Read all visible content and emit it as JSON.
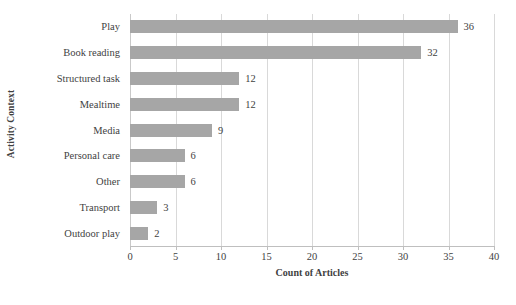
{
  "chart_data": {
    "type": "bar",
    "orientation": "horizontal",
    "title": "",
    "xlabel": "Count of Articles",
    "ylabel": "Activity Context",
    "categories": [
      "Play",
      "Book reading",
      "Structured task",
      "Mealtime",
      "Media",
      "Personal care",
      "Other",
      "Transport",
      "Outdoor play"
    ],
    "values": [
      36,
      32,
      12,
      12,
      9,
      6,
      6,
      3,
      2
    ],
    "xlim": [
      0,
      40
    ],
    "xticks": [
      0,
      5,
      10,
      15,
      20,
      25,
      30,
      35,
      40
    ],
    "grid": "vertical",
    "legend": "none",
    "bar_color": "#a6a6a6",
    "gridline_color": "#d9d9d9"
  },
  "caption": {
    "text": ""
  }
}
